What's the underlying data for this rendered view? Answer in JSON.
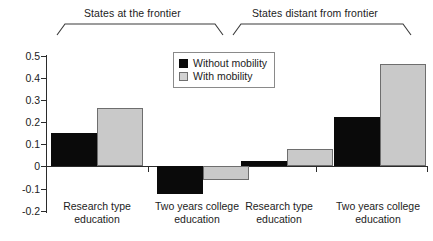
{
  "chart_data": {
    "type": "bar",
    "title": "",
    "subtitle": "",
    "xlabel": "",
    "ylabel": "",
    "ylim": [
      -0.2,
      0.5
    ],
    "ytick_labels": [
      "0.5",
      "0.4",
      "0.3",
      "0.2",
      "0.1",
      "0",
      "-0.1",
      "-0.2"
    ],
    "ytick_values": [
      0.5,
      0.4,
      0.3,
      0.2,
      0.1,
      0,
      -0.1,
      -0.2
    ],
    "grid": false,
    "legend_position": "top-center",
    "zero_line": true,
    "group_labels": [
      "States at the frontier",
      "States distant from frontier"
    ],
    "categories": [
      "Research type education",
      "Two years college education",
      "Research type education",
      "Two years college education"
    ],
    "category_lines": [
      [
        "Research type",
        "education"
      ],
      [
        "Two years college",
        "education"
      ],
      [
        "Research type",
        "education"
      ],
      [
        "Two years college",
        "education"
      ]
    ],
    "category_groups": [
      0,
      0,
      1,
      1
    ],
    "series": [
      {
        "name": "Without mobility",
        "color": "#0a0a0a",
        "values": [
          0.15,
          -0.125,
          0.025,
          0.222
        ]
      },
      {
        "name": "With mobility",
        "color": "#c9c9c9",
        "values": [
          0.265,
          -0.065,
          0.078,
          0.463
        ]
      }
    ],
    "colors": {
      "without_mobility": "#0a0a0a",
      "with_mobility": "#c9c9c9",
      "with_mobility_border": "#6e6e6e",
      "axis": "#2b2b2b",
      "text": "#1c1c1c",
      "background": "#ffffff"
    }
  },
  "legend": {
    "items": [
      {
        "label": "Without mobility",
        "swatch": "black"
      },
      {
        "label": "With mobility",
        "swatch": "gray"
      }
    ]
  }
}
